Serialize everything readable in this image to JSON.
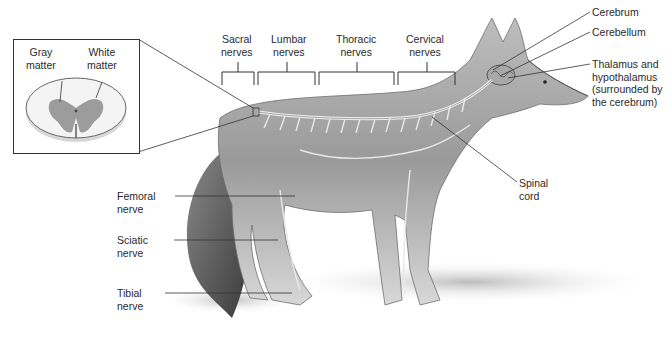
{
  "figure": {
    "inset": {
      "gray_matter": [
        "Gray",
        "matter"
      ],
      "white_matter": [
        "White",
        "matter"
      ]
    },
    "nerve_regions": [
      {
        "line1": "Sacral",
        "line2": "nerves"
      },
      {
        "line1": "Lumbar",
        "line2": "nerves"
      },
      {
        "line1": "Thoracic",
        "line2": "nerves"
      },
      {
        "line1": "Cervical",
        "line2": "nerves"
      }
    ],
    "brain_labels": {
      "cerebrum": "Cerebrum",
      "cerebellum": "Cerebellum",
      "thalamus": [
        "Thalamus and",
        "hypothalamus",
        "(surrounded by",
        "the cerebrum)"
      ]
    },
    "spinal_cord": [
      "Spinal",
      "cord"
    ],
    "leg_nerves": [
      {
        "line1": "Femoral",
        "line2": "nerve"
      },
      {
        "line1": "Sciatic",
        "line2": "nerve"
      },
      {
        "line1": "Tibial",
        "line2": "nerve"
      }
    ]
  }
}
